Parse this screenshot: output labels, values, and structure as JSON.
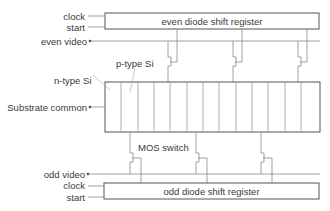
{
  "diagram": {
    "top_register": {
      "label": "even diode shift register"
    },
    "bottom_register": {
      "label": "odd diode shift register"
    },
    "labels": {
      "clock_top": "clock",
      "start_top": "start",
      "even_video": "even video",
      "p_type": "p-type Si",
      "n_type": "n-type Si",
      "substrate": "Substrate common",
      "mos_switch": "MOS switch",
      "odd_video": "odd video",
      "clock_bottom": "clock",
      "start_bottom": "start"
    },
    "diode_count": 13,
    "colors": {
      "line": "#555555",
      "light_line": "#999999",
      "text": "#3a3a3a"
    }
  }
}
